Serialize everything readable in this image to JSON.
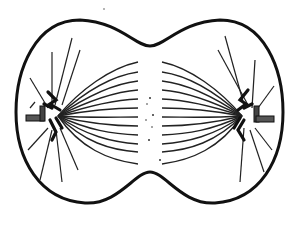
{
  "diagram": {
    "subject": "cell division (late anaphase / early telophase) with spindle fibers",
    "colors": {
      "ink": "#111111",
      "background": "#ffffff",
      "centriole": "#444444"
    },
    "parts": [
      {
        "id": "cell-membrane",
        "description": "dumbbell-shaped cell outline with cleavage furrow"
      },
      {
        "id": "left-pole",
        "description": "left centriole pair with chromosomes and aster"
      },
      {
        "id": "right-pole",
        "description": "right centriole pair with chromosomes and aster"
      },
      {
        "id": "spindle-fibers",
        "description": "curved fibers spanning between poles"
      },
      {
        "id": "astral-rays",
        "description": "straight rays radiating toward membrane"
      }
    ],
    "labels": []
  }
}
